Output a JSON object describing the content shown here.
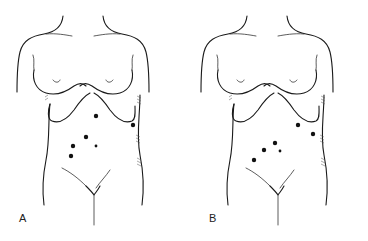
{
  "figure": {
    "panels": [
      {
        "label": "A",
        "offset_x": 0,
        "dots": [
          {
            "x": 96,
            "y": 116,
            "r": 2.2
          },
          {
            "x": 133,
            "y": 125,
            "r": 2.2
          },
          {
            "x": 86,
            "y": 137,
            "r": 2.2
          },
          {
            "x": 73,
            "y": 146,
            "r": 2.2
          },
          {
            "x": 96,
            "y": 146,
            "r": 1.4
          },
          {
            "x": 71,
            "y": 156,
            "r": 2.2
          }
        ]
      },
      {
        "label": "B",
        "offset_x": 184,
        "dots": [
          {
            "x": 298,
            "y": 125,
            "r": 2.2
          },
          {
            "x": 313,
            "y": 134,
            "r": 2.2
          },
          {
            "x": 275,
            "y": 143,
            "r": 2.2
          },
          {
            "x": 264,
            "y": 150,
            "r": 2.2
          },
          {
            "x": 280,
            "y": 151,
            "r": 1.4
          },
          {
            "x": 254,
            "y": 160,
            "r": 2.2
          }
        ]
      }
    ],
    "colors": {
      "line": "#1a1a1a",
      "dot": "#111111",
      "background": "#ffffff"
    }
  }
}
